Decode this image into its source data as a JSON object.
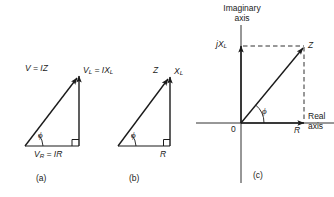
{
  "figure": {
    "background_color": "#ffffff",
    "line_color": "#1a1a1a"
  },
  "diagrams": [
    {
      "id": "a",
      "caption": "(a)",
      "type": "voltage-phasor-triangle",
      "labels": {
        "hypotenuse": "V = IZ",
        "vertical": "VL = IXL",
        "vertical_base": "V",
        "vertical_sub": "L",
        "vertical_rhs": " = IX",
        "vertical_rhs_sub": "L",
        "horizontal_base": "V",
        "horizontal_sub": "R",
        "horizontal_rhs": " = IR",
        "horizontal": "VR = IR",
        "angle": "ϕ"
      }
    },
    {
      "id": "b",
      "caption": "(b)",
      "type": "impedance-triangle",
      "labels": {
        "hypotenuse": "Z",
        "vertical_base": "X",
        "vertical_sub": "L",
        "vertical": "XL",
        "horizontal": "R",
        "angle": "ϕ"
      }
    },
    {
      "id": "c",
      "caption": "(c)",
      "type": "complex-plane-impedance",
      "labels": {
        "imaginary_axis_line1": "Imaginary",
        "imaginary_axis_line2": "axis",
        "real_axis_line1": "Real",
        "real_axis_line2": "axis",
        "origin": "0",
        "imaginary_component_base": "jX",
        "imaginary_component_sub": "L",
        "imaginary_component": "jXL",
        "real_component": "R",
        "impedance_vector": "Z",
        "angle": "ϕ"
      }
    }
  ]
}
